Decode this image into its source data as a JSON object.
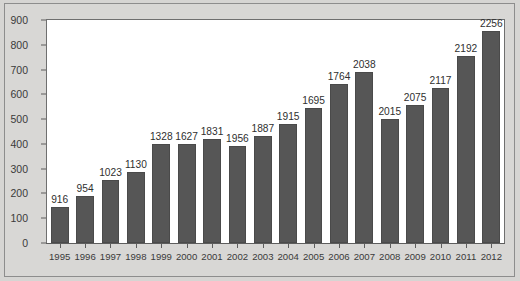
{
  "chart_data": {
    "type": "bar",
    "title": "",
    "subtitle": "",
    "xlabel": "",
    "ylabel": "",
    "categories": [
      "1995",
      "1996",
      "1997",
      "1998",
      "1999",
      "2000",
      "2001",
      "2002",
      "2003",
      "2004",
      "2005",
      "2006",
      "2007",
      "2008",
      "2009",
      "2010",
      "2011",
      "2012"
    ],
    "values": [
      145,
      190,
      255,
      285,
      400,
      400,
      420,
      390,
      430,
      480,
      545,
      640,
      690,
      500,
      555,
      625,
      755,
      855
    ],
    "point_labels": [
      "916",
      "954",
      "1023",
      "1130",
      "1328",
      "1627",
      "1831",
      "1956",
      "1887",
      "1915",
      "1695",
      "1764",
      "2038",
      "2015",
      "2075",
      "2117",
      "2192",
      "2256"
    ],
    "ylim": [
      0,
      900
    ],
    "yticks": [
      0,
      100,
      200,
      300,
      400,
      500,
      600,
      700,
      800,
      900
    ],
    "ytick_labels": [
      "0",
      "100",
      "200",
      "300",
      "400",
      "500",
      "600",
      "700",
      "800",
      "900"
    ],
    "grid": false,
    "legend": false,
    "legend_position": "none",
    "bar_color": "#565656",
    "plot_background": "#ffffff",
    "figure_background": "#d6d5d3",
    "axis_color": "#5d5d5d",
    "text_color": "#3a3a3a"
  }
}
